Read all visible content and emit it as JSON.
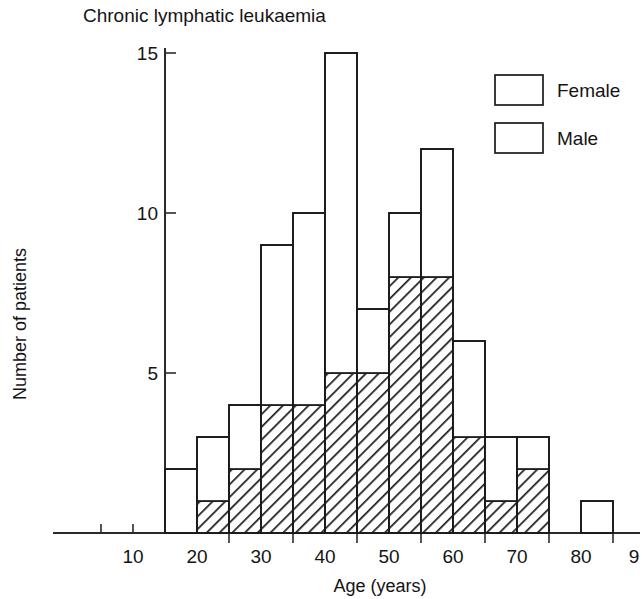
{
  "chart_data": {
    "type": "bar",
    "subtype": "stacked-histogram",
    "title": "Chronic lymphatic leukaemia",
    "xlabel": "Age (years)",
    "ylabel": "Number of patients",
    "xlim": [
      0,
      90
    ],
    "ylim": [
      0,
      15
    ],
    "bin_width": 5,
    "grid": false,
    "legend_position": "top-right",
    "x_tick_labels": [
      "10",
      "20",
      "30",
      "40",
      "50",
      "60",
      "70",
      "80",
      "9"
    ],
    "x_tick_values": [
      10,
      20,
      30,
      40,
      50,
      60,
      70,
      80,
      90
    ],
    "x_minor_ticks": [
      5,
      10,
      15
    ],
    "y_tick_labels": [
      "5",
      "10",
      "15"
    ],
    "y_tick_values": [
      5,
      10,
      15
    ],
    "categories": [
      "15-20",
      "20-25",
      "25-30",
      "30-35",
      "35-40",
      "40-45",
      "45-50",
      "50-55",
      "55-60",
      "60-65",
      "65-70",
      "70-75",
      "80-85"
    ],
    "bin_starts": [
      15,
      20,
      25,
      30,
      35,
      40,
      45,
      50,
      55,
      60,
      65,
      70,
      80
    ],
    "series": [
      {
        "name": "Female",
        "fill": "solid-white",
        "color": "#ffffff",
        "values": [
          2,
          2,
          2,
          5,
          6,
          10,
          2,
          2,
          4,
          3,
          2,
          1,
          1
        ]
      },
      {
        "name": "Male",
        "fill": "diagonal-hatch",
        "color": "#ffffff",
        "values": [
          0,
          1,
          2,
          4,
          4,
          5,
          5,
          8,
          8,
          3,
          1,
          2,
          0
        ]
      }
    ],
    "totals": [
      2,
      3,
      4,
      9,
      10,
      15,
      7,
      10,
      12,
      6,
      3,
      3,
      1
    ]
  },
  "legend": {
    "items": [
      {
        "label": "Female",
        "swatch": "white-box-swatch"
      },
      {
        "label": "Male",
        "swatch": "hatched-box-swatch"
      }
    ]
  },
  "colors": {
    "ink": "#1a1a1a",
    "axis": "#2b2b2b",
    "background": "#ffffff"
  }
}
